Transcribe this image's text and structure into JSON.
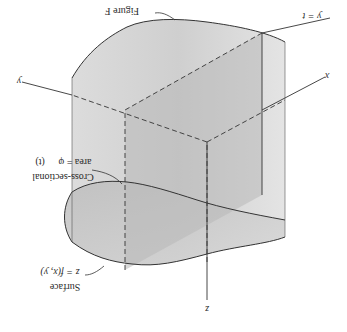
{
  "figure": {
    "orientation": "rotated 180 degrees",
    "labels": {
      "figure_name": "Figure F",
      "plane": "y = t",
      "x_axis": "x",
      "y_axis": "y",
      "z_axis": "z",
      "cross_section_line1": "Cross-sectional",
      "cross_section_line2": "area = φ",
      "cross_section_line3": "(t)",
      "surface_line1": "Surface",
      "surface_line2": "z = f(x, y)"
    },
    "colors": {
      "solid_fill_light": "#e6e6e6",
      "solid_fill_mid": "#c9c9c9",
      "plane_fill": "#b5b5b5",
      "stroke": "#333333",
      "background": "#ffffff"
    }
  }
}
